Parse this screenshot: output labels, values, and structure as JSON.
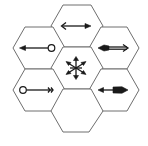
{
  "diagram": {
    "type": "hexagonal-grid",
    "cell_count": 7,
    "colors": {
      "stroke": "#6e6e6e",
      "glyph": "#1a1a1a",
      "background": "#ffffff"
    },
    "cells": [
      {
        "position": "top",
        "glyph": "double-arrow-open-left-filled-right"
      },
      {
        "position": "upper-left",
        "glyph": "arrow-left-from-open-circle"
      },
      {
        "position": "upper-right",
        "glyph": "double-arrow-heavy-left-open-right"
      },
      {
        "position": "center",
        "glyph": "six-way-star-arrows"
      },
      {
        "position": "lower-left",
        "glyph": "open-circle-to-feather-tail"
      },
      {
        "position": "lower-right",
        "glyph": "double-arrow-filled-left-heavy-right"
      },
      {
        "position": "bottom",
        "glyph": "empty"
      }
    ]
  }
}
